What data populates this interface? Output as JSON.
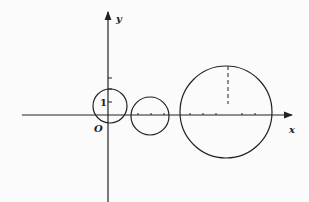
{
  "diagram": {
    "axes": {
      "x_label": "x",
      "y_label": "y",
      "origin_label": "O"
    },
    "unit_label": "1",
    "circles": [
      {
        "name": "small-circle",
        "cx": 110,
        "cy": 107,
        "r": 18
      },
      {
        "name": "medium-circle",
        "cx": 150,
        "cy": 116,
        "r": 19
      },
      {
        "name": "large-circle",
        "cx": 225,
        "cy": 113,
        "r": 46
      }
    ],
    "colors": {
      "stroke": "#222222",
      "background": "#fbfbfb"
    }
  }
}
